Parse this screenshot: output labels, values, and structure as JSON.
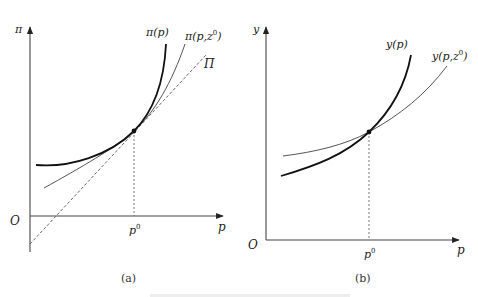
{
  "panels": [
    {
      "id": "a",
      "caption": "(a)",
      "y_axis_label": "π",
      "x_axis_label": "p",
      "origin_label": "O",
      "tick_label": "p",
      "tick_sup": "0",
      "curves": [
        {
          "name": "π(p)",
          "label_main": "π(p)",
          "style": "thick"
        },
        {
          "name": "π(p,z0)",
          "label_main": "π(p,z",
          "label_sup": "0",
          "label_end": ")",
          "style": "thin"
        },
        {
          "name": "Π",
          "label_main": "Π",
          "style": "dashed"
        }
      ]
    },
    {
      "id": "b",
      "caption": "(b)",
      "y_axis_label": "y",
      "x_axis_label": "p",
      "origin_label": "O",
      "tick_label": "p",
      "tick_sup": "0",
      "curves": [
        {
          "name": "y(p)",
          "label_main": "y(p)",
          "style": "thick"
        },
        {
          "name": "y(p,z0)",
          "label_main": "y(p,z",
          "label_sup": "0",
          "label_end": ")",
          "style": "thin"
        }
      ]
    }
  ],
  "colors": {
    "ink": "#222222",
    "thin": "#555555",
    "dashed": "#555555"
  }
}
